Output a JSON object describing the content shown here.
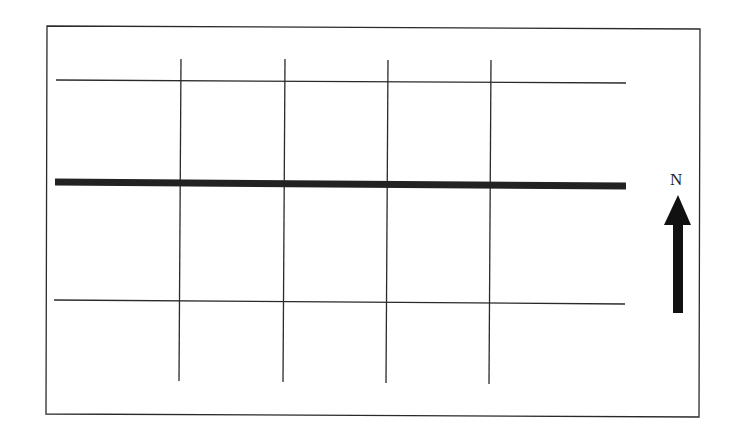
{
  "diagram": {
    "type": "street-grid-map",
    "colors": {
      "line": "#2a2a2a",
      "major_road": "#222222",
      "background": "#ffffff"
    },
    "frame": {
      "x1": 47,
      "y1": 27,
      "x2": 700,
      "y2": 416
    },
    "minor_streets_horizontal": [
      {
        "x1": 56,
        "y1": 80,
        "x2": 626,
        "y2": 83
      },
      {
        "x1": 54,
        "y1": 300,
        "x2": 625,
        "y2": 304
      }
    ],
    "minor_streets_vertical": [
      {
        "x1": 181,
        "y1": 59,
        "x2": 179,
        "y2": 381
      },
      {
        "x1": 285,
        "y1": 59,
        "x2": 283,
        "y2": 382
      },
      {
        "x1": 388,
        "y1": 60,
        "x2": 386,
        "y2": 383
      },
      {
        "x1": 491,
        "y1": 60,
        "x2": 489,
        "y2": 384
      }
    ],
    "major_road": {
      "x1": 55,
      "y1": 182,
      "x2": 626,
      "y2": 186,
      "width": 7
    },
    "north_arrow": {
      "label": "N",
      "head_tip_x": 678,
      "head_tip_y": 195,
      "head_base_y": 225,
      "head_left_x": 664,
      "head_right_x": 691,
      "shaft_left_x": 673,
      "shaft_right_x": 683,
      "shaft_bottom_y": 313
    }
  }
}
